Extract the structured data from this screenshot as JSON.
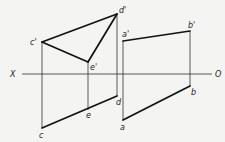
{
  "diagram": {
    "type": "orthographic-projection",
    "axis": {
      "left_label": "X",
      "right_label": "O"
    },
    "points": {
      "c_prime": {
        "label": "c'",
        "x": 42,
        "y": 42
      },
      "d_prime": {
        "label": "d'",
        "x": 117,
        "y": 14
      },
      "e_prime": {
        "label": "e'",
        "x": 88,
        "y": 62
      },
      "a_prime": {
        "label": "a'",
        "x": 123,
        "y": 41
      },
      "b_prime": {
        "label": "b'",
        "x": 190,
        "y": 31
      },
      "c": {
        "label": "c",
        "x": 42,
        "y": 128
      },
      "e": {
        "label": "e",
        "x": 88,
        "y": 110
      },
      "d": {
        "label": "d",
        "x": 117,
        "y": 96
      },
      "a": {
        "label": "a",
        "x": 123,
        "y": 120
      },
      "b": {
        "label": "b",
        "x": 190,
        "y": 86
      }
    }
  }
}
